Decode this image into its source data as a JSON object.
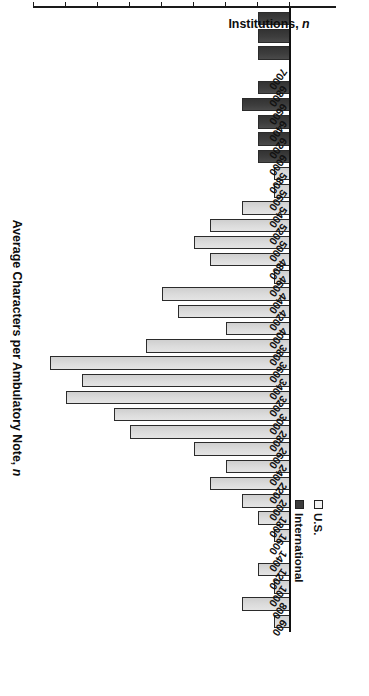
{
  "chart_data": {
    "type": "bar",
    "orientation": "horizontal",
    "title": "",
    "xlabel": "Average Characters per Ambulatory Note, n",
    "ylabel": "Institutions, n",
    "value_axis_label": "Institutions, n",
    "category_axis_label": "Average Characters per Ambulatory Note, n",
    "value_ticks": [
      "0",
      "2",
      "4",
      "6",
      "8",
      "10",
      "12",
      "14",
      "16"
    ],
    "value_tick_values": [
      0,
      2,
      4,
      6,
      8,
      10,
      12,
      14,
      16
    ],
    "ylim": [
      0,
      17
    ],
    "grid": false,
    "legend_position": "top-left",
    "legend": [
      {
        "name": "U.S.",
        "color": "#e0e0e0"
      },
      {
        "name": "International",
        "color": "#3c3c3c"
      }
    ],
    "categories": [
      "600",
      "800",
      "1000",
      "1200",
      "1400",
      "1600",
      "1800",
      "2000",
      "2200",
      "2400",
      "2600",
      "2800",
      "3000",
      "3200",
      "3400",
      "3600",
      "3800",
      "4000",
      "4200",
      "4400",
      "4600",
      "4800",
      "5000",
      "5200",
      "5400",
      "5600",
      "5800",
      "6000",
      "6200",
      "6400",
      "6600",
      "6800",
      "7000"
    ],
    "category_tick_labels": [
      "600",
      "800",
      "1000",
      "1200",
      "1400",
      "1600",
      "1800",
      "2000",
      "2200",
      "2400",
      "2600",
      "2800",
      "3000",
      "3200",
      "3400",
      "3600",
      "3800",
      "4000",
      "4200",
      "4400",
      "4600",
      "4800",
      "5000",
      "5200",
      "5400",
      "5600",
      "5800",
      "6000",
      "6200",
      "6400",
      "6600",
      "6800",
      "7000"
    ],
    "series": [
      {
        "name": "International",
        "color": "#3c3c3c",
        "values": [
          2,
          2,
          2,
          0,
          2,
          3,
          2,
          2,
          2,
          2,
          0,
          0,
          0,
          0,
          0,
          0,
          0,
          0,
          0,
          0,
          0,
          0,
          0,
          0,
          0,
          0,
          0,
          0,
          0,
          0,
          0,
          0,
          0
        ]
      },
      {
        "name": "U.S.",
        "color": "#e0e0e0",
        "values": [
          0,
          0,
          0,
          0,
          0,
          0,
          0,
          0,
          1,
          1,
          3,
          5,
          6,
          5,
          1,
          8,
          7,
          4,
          9,
          15,
          13,
          14,
          11,
          10,
          6,
          4,
          5,
          3,
          2,
          1,
          2,
          0,
          1
        ]
      }
    ],
    "bars": [
      {
        "category": "600",
        "group": "International",
        "value": 2
      },
      {
        "category": "800",
        "group": "International",
        "value": 2
      },
      {
        "category": "1000",
        "group": "International",
        "value": 2
      },
      {
        "category": "1200",
        "group": "International",
        "value": 0
      },
      {
        "category": "1400",
        "group": "International",
        "value": 2
      },
      {
        "category": "1600",
        "group": "International",
        "value": 3
      },
      {
        "category": "1800",
        "group": "International",
        "value": 2
      },
      {
        "category": "2000",
        "group": "International",
        "value": 2
      },
      {
        "category": "2200",
        "group": "International",
        "value": 2
      },
      {
        "category": "2400",
        "group": "International",
        "value": 2
      },
      {
        "category": "2200b",
        "group": "U.S.",
        "value": 1
      },
      {
        "category": "2400b",
        "group": "U.S.",
        "value": 1
      },
      {
        "category": "2600",
        "group": "U.S.",
        "value": 3
      },
      {
        "category": "2800",
        "group": "U.S.",
        "value": 5
      },
      {
        "category": "3000",
        "group": "U.S.",
        "value": 6
      },
      {
        "category": "3200",
        "group": "U.S.",
        "value": 5
      },
      {
        "category": "3400",
        "group": "U.S.",
        "value": 1
      },
      {
        "category": "3600",
        "group": "U.S.",
        "value": 8
      },
      {
        "category": "3800",
        "group": "U.S.",
        "value": 7
      },
      {
        "category": "4000",
        "group": "U.S.",
        "value": 4
      },
      {
        "category": "4200",
        "group": "U.S.",
        "value": 9
      },
      {
        "category": "4400",
        "group": "U.S.",
        "value": 15
      },
      {
        "category": "4600",
        "group": "U.S.",
        "value": 13
      },
      {
        "category": "4800",
        "group": "U.S.",
        "value": 14
      },
      {
        "category": "5000",
        "group": "U.S.",
        "value": 11
      },
      {
        "category": "5200",
        "group": "U.S.",
        "value": 10
      },
      {
        "category": "5400",
        "group": "U.S.",
        "value": 6
      },
      {
        "category": "5600",
        "group": "U.S.",
        "value": 4
      },
      {
        "category": "5800",
        "group": "U.S.",
        "value": 5
      },
      {
        "category": "6000",
        "group": "U.S.",
        "value": 3
      },
      {
        "category": "6200",
        "group": "U.S.",
        "value": 2
      },
      {
        "category": "6400",
        "group": "U.S.",
        "value": 1
      },
      {
        "category": "6600",
        "group": "U.S.",
        "value": 2
      },
      {
        "category": "6800",
        "group": "U.S.",
        "value": 0
      },
      {
        "category": "7000",
        "group": "U.S.",
        "value": 1
      }
    ],
    "bar_sequence": [
      {
        "group": "us",
        "value": 1
      },
      {
        "group": "us",
        "value": 3
      },
      {
        "group": "us",
        "value": 1
      },
      {
        "group": "us",
        "value": 2
      },
      {
        "group": "us",
        "value": 0
      },
      {
        "group": "us",
        "value": 1
      },
      {
        "group": "us",
        "value": 2
      },
      {
        "group": "us",
        "value": 3
      },
      {
        "group": "us",
        "value": 5
      },
      {
        "group": "us",
        "value": 4
      },
      {
        "group": "us",
        "value": 6
      },
      {
        "group": "us",
        "value": 10
      },
      {
        "group": "us",
        "value": 11
      },
      {
        "group": "us",
        "value": 14
      },
      {
        "group": "us",
        "value": 13
      },
      {
        "group": "us",
        "value": 15
      },
      {
        "group": "us",
        "value": 9
      },
      {
        "group": "us",
        "value": 4
      },
      {
        "group": "us",
        "value": 7
      },
      {
        "group": "us",
        "value": 8
      },
      {
        "group": "us",
        "value": 1
      },
      {
        "group": "us",
        "value": 5
      },
      {
        "group": "us",
        "value": 6
      },
      {
        "group": "us",
        "value": 5
      },
      {
        "group": "us",
        "value": 3
      },
      {
        "group": "us",
        "value": 1
      },
      {
        "group": "us",
        "value": 1
      },
      {
        "group": "intl",
        "value": 2
      },
      {
        "group": "intl",
        "value": 2
      },
      {
        "group": "intl",
        "value": 2
      },
      {
        "group": "intl",
        "value": 3
      },
      {
        "group": "intl",
        "value": 2
      },
      {
        "group": "intl",
        "value": 0
      },
      {
        "group": "intl",
        "value": 2
      },
      {
        "group": "intl",
        "value": 2
      },
      {
        "group": "intl",
        "value": 2
      }
    ]
  },
  "legend": {
    "us_label": "U.S.",
    "international_label": "International"
  },
  "axes": {
    "category_title": "Average Characters per Ambulatory Note, n",
    "category_title_main": "Average Characters per Ambulatory Note,",
    "category_title_italic": "n",
    "value_title_main": "Institutions,",
    "value_title_italic": "n"
  }
}
